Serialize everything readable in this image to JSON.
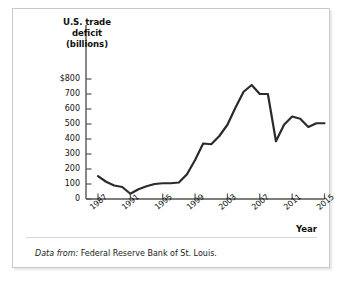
{
  "figure": {
    "y_axis_title": "U.S. trade deficit (billions)",
    "y_axis_title_lines": [
      "U.S. trade",
      "deficit",
      "(billions)"
    ],
    "x_axis_title": "Year",
    "source_lead": "Data from:",
    "source_text": "Federal Reserve Bank of St. Louis.",
    "line_color": "#2b2b2b",
    "axis_color": "#555555",
    "frame_color": "#c9c9c9",
    "background": "#ffffff"
  },
  "chart_data": {
    "type": "line",
    "title": "",
    "xlabel": "Year",
    "ylabel": "U.S. trade deficit (billions)",
    "xlim": [
      1987,
      2015
    ],
    "ylim": [
      0,
      800
    ],
    "grid": false,
    "legend": "none",
    "y_ticks": [
      0,
      100,
      200,
      300,
      400,
      500,
      600,
      700,
      800
    ],
    "y_tick_labels": [
      "0",
      "100",
      "200",
      "300",
      "400",
      "500",
      "600",
      "700",
      "$800"
    ],
    "x_ticks": [
      1987,
      1991,
      1995,
      1999,
      2003,
      2007,
      2011,
      2015
    ],
    "x_tick_labels": [
      "1987",
      "1991",
      "1995",
      "1999",
      "2003",
      "2007",
      "2011",
      "2015"
    ],
    "x": [
      1987,
      1988,
      1989,
      1990,
      1991,
      1992,
      1993,
      1994,
      1995,
      1996,
      1997,
      1998,
      1999,
      2000,
      2001,
      2002,
      2003,
      2004,
      2005,
      2006,
      2007,
      2008,
      2009,
      2010,
      2011,
      2012,
      2013,
      2014,
      2015
    ],
    "series": [
      {
        "name": "U.S. trade deficit",
        "values": [
          152,
          115,
          90,
          80,
          35,
          65,
          85,
          100,
          105,
          105,
          110,
          165,
          260,
          370,
          365,
          420,
          495,
          610,
          715,
          760,
          700,
          700,
          385,
          495,
          550,
          535,
          480,
          505,
          505
        ]
      }
    ]
  }
}
